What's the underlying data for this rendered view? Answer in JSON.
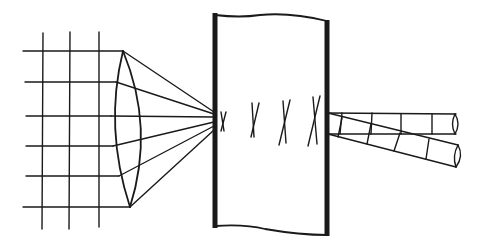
{
  "diagram": {
    "title": "",
    "components": [
      {
        "id": "grid",
        "label": "image grid (6 horizontal, 3 vertical lines)"
      },
      {
        "id": "lens",
        "label": "biconvex lens"
      },
      {
        "id": "rays",
        "label": "converging rays (6)"
      },
      {
        "id": "slab",
        "label": "slab / block"
      },
      {
        "id": "marks",
        "label": "crossed line marks (4)"
      },
      {
        "id": "tube-upper",
        "label": "upper cylindrical tube, 4 segments"
      },
      {
        "id": "tube-lower",
        "label": "lower cylindrical tube, 4 segments, angled down"
      }
    ],
    "colors": {
      "ink": "#1a1a1a",
      "background": "#ffffff"
    }
  }
}
